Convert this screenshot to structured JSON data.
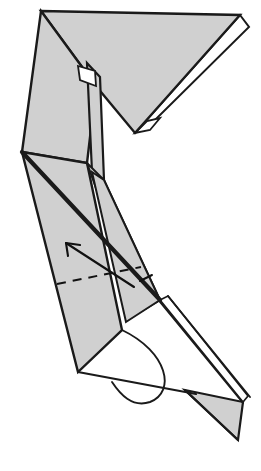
{
  "diagram": {
    "type": "origami-folding-instruction",
    "canvas": {
      "width": 261,
      "height": 471,
      "background": "#ffffff"
    },
    "colors": {
      "paper_front": "#d0d0d0",
      "paper_back": "#ffffff",
      "ink": "#1a1a1a",
      "arrow": "#111111"
    },
    "stroke_widths": {
      "outline": 2.2,
      "thick_crease": 4.0,
      "thin_edge": 1.6,
      "arrow": 2.0,
      "dash": 2.0
    },
    "shapes": {
      "top_triangle": {
        "name": "top-triangle-flap",
        "fill": "paper_front",
        "points": "41,11 240,15 135,133 96,86"
      },
      "top_triangle_underlayer": {
        "name": "top-triangle-under-layer",
        "fill": "paper_back",
        "points": "240,15 249,27 155,120 135,133"
      },
      "top_triangle_under_tip": {
        "name": "top-triangle-under-tip",
        "fill": "paper_back",
        "points": "135,133 147,121 160,118 150,130"
      },
      "neck_left_panel": {
        "name": "neck-left-panel",
        "fill": "paper_front",
        "points": "41,11 96,86 87,163 22,152"
      },
      "neck_notch": {
        "name": "neck-notch-gap",
        "fill": "paper_back",
        "points": "78,66 95,71 96,86 80,80"
      },
      "neck_right_strip": {
        "name": "neck-right-strip",
        "fill": "paper_front",
        "points": "87,63 100,77 104,180 92,172"
      },
      "mid_left_wing": {
        "name": "mid-left-wing-panel",
        "fill": "paper_front",
        "points": "22,152 87,163 122,330 78,372"
      },
      "mid_right_wing": {
        "name": "mid-right-wing-panel",
        "fill": "paper_front",
        "points": "92,172 104,180 160,300 126,322"
      },
      "lower_wedge": {
        "name": "lower-wedge-panel",
        "fill": "paper_front",
        "points": "87,163 104,180 160,300 140,312"
      },
      "bottom_tail": {
        "name": "bottom-tail-triangle",
        "fill": "paper_front",
        "points": "185,390 243,402 238,440"
      },
      "bottom_tail_strip": {
        "name": "bottom-tail-white-strip",
        "fill": "paper_back",
        "points": "160,300 168,296 248,396 243,402"
      }
    },
    "lines": {
      "thick_center_crease": {
        "name": "thick-center-crease",
        "path": "M 22,152 L 160,300"
      },
      "lower_white_edge_outer": {
        "name": "lower-white-edge-outer",
        "path": "M 168,296 L 250,397"
      },
      "lower_white_edge_inner": {
        "name": "lower-white-edge-inner",
        "path": "M 160,302 L 243,403"
      },
      "bottom_open_edge": {
        "name": "bottom-open-edge",
        "path": "M 78,372 L 196,394"
      },
      "bottom_curl_hook": {
        "name": "bottom-curl-hook",
        "path": "M 122,330 C 168,352 176,392 150,402 C 132,408 120,394 112,382"
      },
      "tail_inner_edge": {
        "name": "tail-inner-edge",
        "path": "M 185,390 L 238,440"
      }
    },
    "annotations": {
      "valley_fold_arrow": {
        "name": "valley-fold-arrow",
        "shaft": "M 134,287 L 66,243",
        "head_left": "M 66,243 L 68,256",
        "head_right": "M 66,243 L 80,245",
        "direction": "up-left",
        "meaning": "valley fold / fold in direction of arrow"
      },
      "valley_fold_dashes": {
        "name": "valley-fold-dash-line",
        "path": "M 57,284 L 141,267",
        "dash_pattern": "9 7"
      },
      "small_tick_mark": {
        "name": "crease-tick-mark",
        "path": "M 140,281 L 152,275"
      }
    }
  }
}
